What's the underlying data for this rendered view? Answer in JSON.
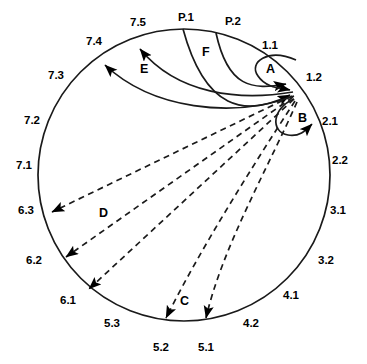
{
  "diagram": {
    "circle": {
      "cx": 184,
      "cy": 175,
      "r": 146,
      "stroke": "#1a1a1a",
      "stroke_width": 1.6
    },
    "hub": {
      "x": 295,
      "y": 94,
      "label": "convergence-point"
    },
    "colors": {
      "ink": "#000000",
      "line": "#1a1a1a",
      "background": "#ffffff"
    },
    "perimeter_labels": [
      {
        "id": "p1",
        "text": "P.1",
        "x": 178,
        "y": 12,
        "anchor": "circle-top"
      },
      {
        "id": "p2",
        "text": "P.2",
        "x": 225,
        "y": 16,
        "anchor": "circle-top-right"
      },
      {
        "id": "s75",
        "text": "7.5",
        "x": 130,
        "y": 17,
        "anchor": "circle-top-left"
      },
      {
        "id": "s74",
        "text": "7.4",
        "x": 86,
        "y": 36,
        "anchor": "circle-upper-left"
      },
      {
        "id": "s73",
        "text": "7.3",
        "x": 48,
        "y": 70,
        "anchor": "circle-left-upper"
      },
      {
        "id": "s72",
        "text": "7.2",
        "x": 24,
        "y": 115,
        "anchor": "circle-left"
      },
      {
        "id": "s71",
        "text": "7.1",
        "x": 16,
        "y": 160,
        "anchor": "circle-left"
      },
      {
        "id": "s63",
        "text": "6.3",
        "x": 18,
        "y": 205,
        "anchor": "circle-left-lower"
      },
      {
        "id": "s62",
        "text": "6.2",
        "x": 26,
        "y": 255,
        "anchor": "circle-lower-left"
      },
      {
        "id": "s61",
        "text": "6.1",
        "x": 60,
        "y": 295,
        "anchor": "circle-bottom-left"
      },
      {
        "id": "s53",
        "text": "5.3",
        "x": 104,
        "y": 318,
        "anchor": "circle-bottom-left"
      },
      {
        "id": "s52",
        "text": "5.2",
        "x": 153,
        "y": 342,
        "anchor": "circle-bottom"
      },
      {
        "id": "s51",
        "text": "5.1",
        "x": 198,
        "y": 342,
        "anchor": "circle-bottom"
      },
      {
        "id": "s42",
        "text": "4.2",
        "x": 243,
        "y": 318,
        "anchor": "circle-bottom-right"
      },
      {
        "id": "s41",
        "text": "4.1",
        "x": 283,
        "y": 290,
        "anchor": "circle-lower-right"
      },
      {
        "id": "s32",
        "text": "3.2",
        "x": 318,
        "y": 255,
        "anchor": "circle-right-lower"
      },
      {
        "id": "s31",
        "text": "3.1",
        "x": 330,
        "y": 205,
        "anchor": "circle-right"
      },
      {
        "id": "s22",
        "text": "2.2",
        "x": 332,
        "y": 155,
        "anchor": "circle-right"
      },
      {
        "id": "s21",
        "text": "2.1",
        "x": 322,
        "y": 116,
        "anchor": "circle-right-upper"
      },
      {
        "id": "s12",
        "text": "1.2",
        "x": 306,
        "y": 72,
        "anchor": "circle-upper-right"
      },
      {
        "id": "s11",
        "text": "1.1",
        "x": 262,
        "y": 40,
        "anchor": "circle-top-right"
      }
    ],
    "arc_labels": [
      {
        "id": "A",
        "text": "A",
        "x": 266,
        "y": 63,
        "kind": "solid-loop"
      },
      {
        "id": "B",
        "text": "B",
        "x": 298,
        "y": 112,
        "kind": "solid-loop"
      },
      {
        "id": "C",
        "text": "C",
        "x": 180,
        "y": 295,
        "kind": "dashed-fan"
      },
      {
        "id": "D",
        "text": "D",
        "x": 99,
        "y": 207,
        "kind": "dashed-fan"
      },
      {
        "id": "E",
        "text": "E",
        "x": 140,
        "y": 63,
        "kind": "solid-fan"
      },
      {
        "id": "F",
        "text": "F",
        "x": 202,
        "y": 46,
        "kind": "solid-fan"
      }
    ],
    "connections": [
      {
        "group": "A",
        "style": "solid",
        "from": "1.1",
        "to": "hub",
        "direction": "inbound",
        "count": 1
      },
      {
        "group": "B",
        "style": "solid",
        "from": "hub",
        "to": "2.1",
        "direction": "outbound",
        "count": 1
      },
      {
        "group": "C",
        "style": "dashed",
        "from": "hub",
        "to": "5.2",
        "direction": "outbound",
        "count": 1
      },
      {
        "group": "C",
        "style": "dashed",
        "from": "hub",
        "to": "5.1",
        "direction": "outbound",
        "count": 1
      },
      {
        "group": "D",
        "style": "dashed",
        "from": "hub",
        "to": "6.3",
        "direction": "outbound",
        "count": 1
      },
      {
        "group": "D",
        "style": "dashed",
        "from": "hub",
        "to": "6.2",
        "direction": "outbound",
        "count": 1
      },
      {
        "group": "D",
        "style": "dashed",
        "from": "hub",
        "to": "6.1",
        "direction": "outbound",
        "count": 1
      },
      {
        "group": "E",
        "style": "solid",
        "from": "hub",
        "to": "7.5",
        "direction": "outbound",
        "count": 1
      },
      {
        "group": "E",
        "style": "solid",
        "from": "hub",
        "to": "7.4",
        "direction": "outbound",
        "count": 1
      },
      {
        "group": "F",
        "style": "solid",
        "from": "P.1",
        "to": "hub",
        "direction": "inbound",
        "count": 1
      },
      {
        "group": "F",
        "style": "solid",
        "from": "P.2",
        "to": "hub",
        "direction": "inbound",
        "count": 1
      }
    ]
  }
}
